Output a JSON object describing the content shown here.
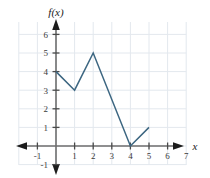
{
  "chart_data": {
    "type": "line",
    "title": "",
    "xlabel": "x",
    "ylabel": "f(x)",
    "xlim": [
      -1.4,
      7.6
    ],
    "ylim": [
      -1.5,
      6.4
    ],
    "grid": true,
    "legend": "none",
    "x_ticks": [
      -1,
      1,
      2,
      3,
      4,
      5,
      6,
      7
    ],
    "x_tick_labels": [
      "-1",
      "1",
      "2",
      "3",
      "4",
      "5",
      "6",
      "7"
    ],
    "y_ticks": [
      -1,
      1,
      2,
      3,
      4,
      5,
      6
    ],
    "y_tick_labels": [
      "-1",
      "1",
      "2",
      "3",
      "4",
      "5",
      "6"
    ],
    "series": [
      {
        "name": "f(x)",
        "color": "#3c6681",
        "x": [
          0,
          1,
          2,
          4,
          5
        ],
        "y": [
          4,
          3,
          5,
          0,
          1
        ],
        "points": [
          {
            "x": 0,
            "y": 4
          },
          {
            "x": 1,
            "y": 3
          },
          {
            "x": 2,
            "y": 5
          },
          {
            "x": 4,
            "y": 0
          },
          {
            "x": 5,
            "y": 1
          }
        ]
      }
    ]
  },
  "labels": {
    "y_axis_name": "f(x)",
    "x_axis_name": "x",
    "x_tick_minus_one": "-1",
    "x_tick_1": "1",
    "x_tick_2": "2",
    "x_tick_3": "3",
    "x_tick_4": "4",
    "x_tick_5": "5",
    "x_tick_6": "6",
    "x_tick_7": "7",
    "y_tick_minus_one": "-1",
    "y_tick_1": "1",
    "y_tick_2": "2",
    "y_tick_3": "3",
    "y_tick_4": "4",
    "y_tick_5": "5",
    "y_tick_6": "6"
  },
  "colors": {
    "curve": "#3c6681",
    "axis": "#6e6e6e",
    "grid": "#e3e8ee",
    "tick_mark": "#4a4a4a",
    "text": "#3a3a3a",
    "background": "#ffffff"
  }
}
